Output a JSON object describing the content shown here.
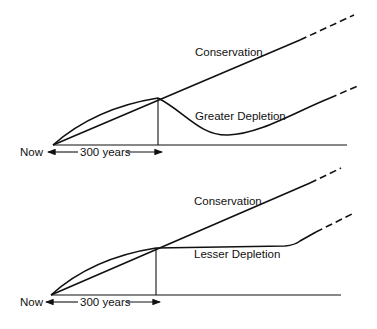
{
  "panels": [
    {
      "id": "greater",
      "labels": {
        "conservation": "Conservation",
        "depletion": "Greater Depletion",
        "now": "Now",
        "span": "300 years"
      }
    },
    {
      "id": "lesser",
      "labels": {
        "conservation": "Conservation",
        "depletion": "Lesser Depletion",
        "now": "Now",
        "span": "300 years"
      }
    }
  ],
  "colors": {
    "line": "#111111",
    "background": "#ffffff"
  }
}
